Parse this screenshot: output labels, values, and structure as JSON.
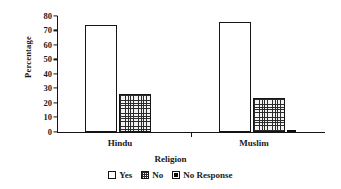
{
  "chart_data": {
    "type": "bar",
    "title": "",
    "subtitle": "",
    "xlabel": "Religion",
    "ylabel": "Percentage",
    "categories": [
      "Hindu",
      "Muslim"
    ],
    "series": [
      {
        "name": "Yes",
        "values": [
          74,
          76
        ]
      },
      {
        "name": "No",
        "values": [
          26,
          23
        ]
      },
      {
        "name": "No Response",
        "values": [
          0,
          1
        ]
      }
    ],
    "yticks": [
      0,
      10,
      20,
      30,
      40,
      50,
      60,
      70,
      80
    ],
    "ylim": [
      0,
      80
    ],
    "grid": false,
    "legend_position": "bottom",
    "legend": [
      {
        "label": "Yes",
        "fill": "empty"
      },
      {
        "label": "No",
        "fill": "crosshatch"
      },
      {
        "label": "No Response",
        "fill": "solid"
      }
    ],
    "colors": {
      "axis": "#151515",
      "yes": "#ffffff",
      "no": "#2b2b2b",
      "no_response": "#0d0d0d",
      "background": "#ffffff"
    }
  }
}
